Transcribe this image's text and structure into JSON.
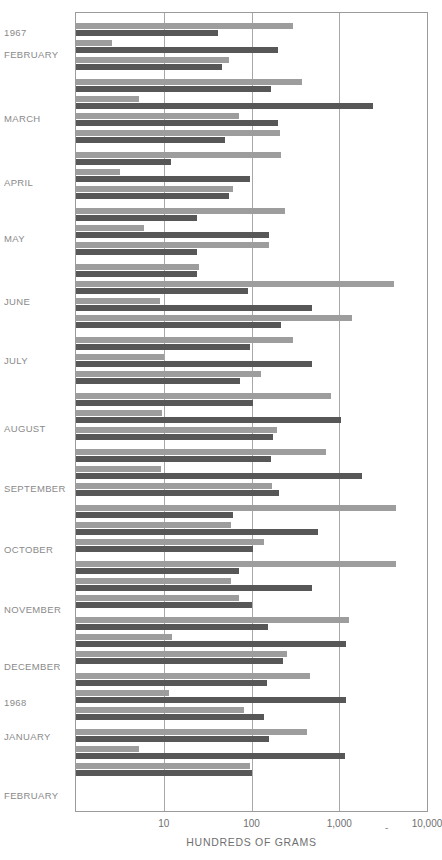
{
  "chart_data": {
    "type": "bar",
    "title": "",
    "subtitle": "",
    "xlabel": "HUNDREDS OF GRAMS",
    "ylabel": "",
    "orientation": "horizontal",
    "xscale": "log",
    "xlim": [
      1,
      10000
    ],
    "grid": true,
    "legend_position": "none",
    "tick_labels": [
      "10",
      "100",
      "1,000",
      "10,000"
    ],
    "tick_values": [
      10,
      100,
      1000,
      10000
    ],
    "axis_separator": "-",
    "series": [
      {
        "name": "light-bar",
        "color": "#9d9d9d"
      },
      {
        "name": "dark-bar",
        "color": "#575757"
      }
    ],
    "categories": [
      "1967",
      "FEBRUARY",
      "MARCH",
      "APRIL",
      "MAY",
      "JUNE",
      "JULY",
      "AUGUST",
      "SEPTEMBER",
      "OCTOBER",
      "NOVEMBER",
      "DECEMBER",
      "1968",
      "JANUARY",
      "FEBRUARY"
    ],
    "month_label_positions": [
      {
        "label": "1967",
        "y": 28
      },
      {
        "label": "FEBRUARY",
        "y": 50
      },
      {
        "label": "MARCH",
        "y": 114
      },
      {
        "label": "APRIL",
        "y": 178
      },
      {
        "label": "MAY",
        "y": 234
      },
      {
        "label": "JUNE",
        "y": 297
      },
      {
        "label": "JULY",
        "y": 356
      },
      {
        "label": "AUGUST",
        "y": 424
      },
      {
        "label": "SEPTEMBER",
        "y": 484
      },
      {
        "label": "OCTOBER",
        "y": 545
      },
      {
        "label": "NOVEMBER",
        "y": 605
      },
      {
        "label": "DECEMBER",
        "y": 662
      },
      {
        "label": "1968",
        "y": 698
      },
      {
        "label": "JANUARY",
        "y": 732
      },
      {
        "label": "FEBRUARY",
        "y": 791
      }
    ],
    "pairs": [
      {
        "y": 10,
        "light": 300,
        "dark": 42
      },
      {
        "y": 27,
        "light": 2.6,
        "dark": 200
      },
      {
        "y": 44,
        "light": 55,
        "dark": 46
      },
      {
        "y": 66,
        "light": 380,
        "dark": 165
      },
      {
        "y": 83,
        "light": 5.2,
        "dark": 2400
      },
      {
        "y": 100,
        "light": 72,
        "dark": 200
      },
      {
        "y": 117,
        "light": 210,
        "dark": 50
      },
      {
        "y": 139,
        "light": 215,
        "dark": 12
      },
      {
        "y": 156,
        "light": 3.2,
        "dark": 95
      },
      {
        "y": 173,
        "light": 62,
        "dark": 55
      },
      {
        "y": 195,
        "light": 240,
        "dark": 24
      },
      {
        "y": 212,
        "light": 6.0,
        "dark": 160
      },
      {
        "y": 229,
        "light": 160,
        "dark": 24
      },
      {
        "y": 251,
        "light": 25,
        "dark": 24
      },
      {
        "y": 268,
        "light": 4200,
        "dark": 92
      },
      {
        "y": 285,
        "light": 9.0,
        "dark": 490
      },
      {
        "y": 302,
        "light": 1400,
        "dark": 215
      },
      {
        "y": 324,
        "light": 300,
        "dark": 97
      },
      {
        "y": 341,
        "light": 10.0,
        "dark": 490
      },
      {
        "y": 358,
        "light": 130,
        "dark": 73
      },
      {
        "y": 380,
        "light": 800,
        "dark": 105
      },
      {
        "y": 397,
        "light": 9.5,
        "dark": 1050
      },
      {
        "y": 414,
        "light": 195,
        "dark": 175
      },
      {
        "y": 436,
        "light": 700,
        "dark": 165
      },
      {
        "y": 453,
        "light": 9.2,
        "dark": 1800
      },
      {
        "y": 470,
        "light": 170,
        "dark": 205
      },
      {
        "y": 492,
        "light": 4400,
        "dark": 62
      },
      {
        "y": 509,
        "light": 58,
        "dark": 580
      },
      {
        "y": 526,
        "light": 140,
        "dark": 105
      },
      {
        "y": 548,
        "light": 4400,
        "dark": 72
      },
      {
        "y": 565,
        "light": 58,
        "dark": 490
      },
      {
        "y": 582,
        "light": 72,
        "dark": 100
      },
      {
        "y": 604,
        "light": 1300,
        "dark": 155
      },
      {
        "y": 621,
        "light": 12.5,
        "dark": 1200
      },
      {
        "y": 638,
        "light": 255,
        "dark": 230
      },
      {
        "y": 660,
        "light": 470,
        "dark": 150
      },
      {
        "y": 677,
        "light": 11.5,
        "dark": 1200
      },
      {
        "y": 694,
        "light": 82,
        "dark": 140
      },
      {
        "y": 716,
        "light": 430,
        "dark": 160
      },
      {
        "y": 733,
        "light": 5.2,
        "dark": 1150
      },
      {
        "y": 750,
        "light": 95,
        "dark": 100
      }
    ]
  }
}
